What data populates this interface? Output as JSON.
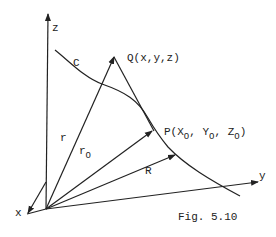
{
  "figure": {
    "caption": "Fig. 5.10",
    "axes": {
      "z": {
        "label": "z"
      },
      "y": {
        "label": "y"
      },
      "x": {
        "label": "x"
      }
    },
    "curve": {
      "label": "C"
    },
    "points": {
      "Q": {
        "label": "Q(x,y,z)"
      },
      "P": {
        "label_prefix": "P(X",
        "sub": "O",
        "sep1": ", Y",
        "sep2": ", Z",
        "suffix": ")"
      }
    },
    "vectors": {
      "r": {
        "label": "r"
      },
      "r0": {
        "label": "r",
        "sub": "O"
      },
      "R": {
        "label": "R"
      }
    },
    "colors": {
      "ink": "#222222",
      "background": "#ffffff"
    }
  }
}
